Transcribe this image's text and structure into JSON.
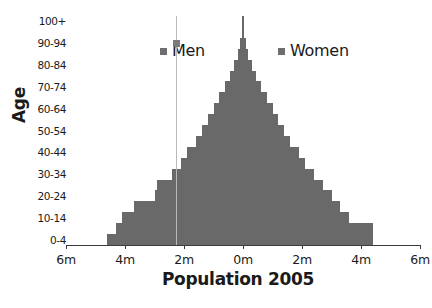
{
  "chart_data": {
    "type": "bar",
    "subtype": "population-pyramid",
    "title": "Population 2005",
    "xlabel": "Population 2005",
    "ylabel": "Age",
    "orientation": "horizontal",
    "grid": false,
    "legend_position": "top-center",
    "xlim": [
      -6,
      6
    ],
    "x_unit": "millions",
    "xtick_labels": [
      "6m",
      "4m",
      "2m",
      "0m",
      "2m",
      "4m",
      "6m"
    ],
    "xtick_values": [
      -6,
      -4,
      -2,
      0,
      2,
      4,
      6
    ],
    "ytick_labels": [
      "0-4",
      "10-14",
      "20-24",
      "30-34",
      "40-44",
      "50-54",
      "60-64",
      "70-74",
      "80-84",
      "90-94",
      "100+"
    ],
    "categories": [
      "0-4",
      "5-9",
      "10-14",
      "15-19",
      "20-24",
      "25-29",
      "30-34",
      "35-39",
      "40-44",
      "45-49",
      "50-54",
      "55-59",
      "60-64",
      "65-69",
      "70-74",
      "75-79",
      "80-84",
      "85-89",
      "90-94",
      "95-99",
      "100+"
    ],
    "series": [
      {
        "name": "Men",
        "color": "#696969",
        "side": "left",
        "values": [
          4.6,
          4.3,
          4.1,
          3.7,
          3.0,
          2.9,
          2.4,
          2.1,
          1.9,
          1.6,
          1.4,
          1.2,
          1.0,
          0.8,
          0.6,
          0.45,
          0.3,
          0.18,
          0.1,
          0.05,
          0.02
        ]
      },
      {
        "name": "Women",
        "color": "#696969",
        "side": "right",
        "values": [
          4.4,
          4.4,
          3.6,
          3.3,
          3.0,
          2.7,
          2.4,
          2.1,
          1.9,
          1.6,
          1.4,
          1.2,
          1.0,
          0.8,
          0.6,
          0.45,
          0.3,
          0.18,
          0.1,
          0.05,
          0.02
        ]
      }
    ]
  },
  "legend": {
    "men_label": "Men",
    "women_label": "Women"
  },
  "axes": {
    "y_title": "Age",
    "x_title": "Population 2005"
  }
}
